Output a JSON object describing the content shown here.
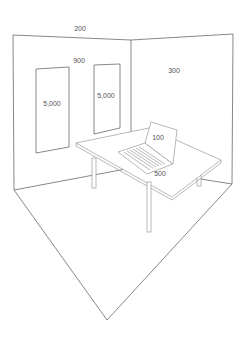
{
  "diagram": {
    "labels": {
      "ceiling": "200",
      "back_wall": "900",
      "right_wall": "300",
      "window_left": "5,000",
      "window_right": "5,000",
      "laptop_screen": "100",
      "desk_surface": "500"
    },
    "colors": {
      "line": "#6a6a6a",
      "text": "#555555",
      "background": "#ffffff"
    }
  }
}
